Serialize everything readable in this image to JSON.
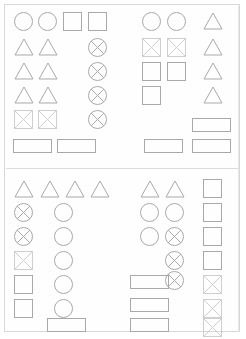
{
  "canvas": {
    "width": 246,
    "height": 339,
    "background": "#ffffff",
    "border_color": "#d8d8d8",
    "stroke_color": "#a9a9a9",
    "faint_stroke_color": "#cfcfcf"
  },
  "document": {
    "title": "Wireframe placeholder shape layout",
    "description": "Two-section page of outline placeholder glyphs arranged in columns",
    "section_count": 2,
    "divider_y": 168
  },
  "legend": {
    "shape_names": [
      "circle",
      "square",
      "triangle",
      "rectangle",
      "crossed-circle",
      "crossed-square"
    ]
  },
  "shapes": [
    {
      "id": "s1",
      "type": "circle",
      "x": 14,
      "y": 12,
      "w": 19,
      "h": 19,
      "faint": false
    },
    {
      "id": "s2",
      "type": "circle",
      "x": 38,
      "y": 12,
      "w": 19,
      "h": 19,
      "faint": false
    },
    {
      "id": "s3",
      "type": "square",
      "x": 63,
      "y": 12,
      "w": 19,
      "h": 19,
      "faint": false
    },
    {
      "id": "s4",
      "type": "square",
      "x": 88,
      "y": 12,
      "w": 19,
      "h": 19,
      "faint": false
    },
    {
      "id": "s5",
      "type": "triangle",
      "x": 14,
      "y": 38,
      "w": 20,
      "h": 18,
      "faint": false
    },
    {
      "id": "s6",
      "type": "triangle",
      "x": 38,
      "y": 38,
      "w": 20,
      "h": 18,
      "faint": false
    },
    {
      "id": "s7",
      "type": "crossed-circle",
      "x": 88,
      "y": 38,
      "w": 19,
      "h": 19,
      "faint": false
    },
    {
      "id": "s8",
      "type": "triangle",
      "x": 14,
      "y": 62,
      "w": 20,
      "h": 18,
      "faint": false
    },
    {
      "id": "s9",
      "type": "triangle",
      "x": 38,
      "y": 62,
      "w": 20,
      "h": 18,
      "faint": false
    },
    {
      "id": "s10",
      "type": "crossed-circle",
      "x": 88,
      "y": 62,
      "w": 19,
      "h": 19,
      "faint": false
    },
    {
      "id": "s11",
      "type": "triangle",
      "x": 14,
      "y": 86,
      "w": 20,
      "h": 18,
      "faint": false
    },
    {
      "id": "s12",
      "type": "triangle",
      "x": 38,
      "y": 86,
      "w": 20,
      "h": 18,
      "faint": false
    },
    {
      "id": "s13",
      "type": "crossed-circle",
      "x": 88,
      "y": 86,
      "w": 19,
      "h": 19,
      "faint": false
    },
    {
      "id": "s14",
      "type": "crossed-square",
      "x": 14,
      "y": 110,
      "w": 19,
      "h": 19,
      "faint": true
    },
    {
      "id": "s15",
      "type": "crossed-square",
      "x": 38,
      "y": 110,
      "w": 19,
      "h": 19,
      "faint": true
    },
    {
      "id": "s16",
      "type": "crossed-circle",
      "x": 88,
      "y": 110,
      "w": 19,
      "h": 19,
      "faint": false
    },
    {
      "id": "s17",
      "type": "rectangle",
      "x": 13,
      "y": 139,
      "w": 39,
      "h": 14,
      "faint": false
    },
    {
      "id": "s18",
      "type": "rectangle",
      "x": 57,
      "y": 139,
      "w": 39,
      "h": 14,
      "faint": false
    },
    {
      "id": "s19",
      "type": "circle",
      "x": 142,
      "y": 12,
      "w": 19,
      "h": 19,
      "faint": false
    },
    {
      "id": "s20",
      "type": "circle",
      "x": 167,
      "y": 12,
      "w": 19,
      "h": 19,
      "faint": false
    },
    {
      "id": "s21",
      "type": "triangle",
      "x": 203,
      "y": 12,
      "w": 20,
      "h": 18,
      "faint": false
    },
    {
      "id": "s22",
      "type": "crossed-square",
      "x": 142,
      "y": 38,
      "w": 19,
      "h": 19,
      "faint": true
    },
    {
      "id": "s23",
      "type": "crossed-square",
      "x": 167,
      "y": 38,
      "w": 19,
      "h": 19,
      "faint": true
    },
    {
      "id": "s24",
      "type": "triangle",
      "x": 203,
      "y": 38,
      "w": 20,
      "h": 18,
      "faint": false
    },
    {
      "id": "s25",
      "type": "square",
      "x": 142,
      "y": 62,
      "w": 19,
      "h": 19,
      "faint": false
    },
    {
      "id": "s26",
      "type": "square",
      "x": 167,
      "y": 62,
      "w": 19,
      "h": 19,
      "faint": false
    },
    {
      "id": "s27",
      "type": "triangle",
      "x": 203,
      "y": 62,
      "w": 20,
      "h": 18,
      "faint": false
    },
    {
      "id": "s28",
      "type": "square",
      "x": 142,
      "y": 86,
      "w": 19,
      "h": 19,
      "faint": false
    },
    {
      "id": "s29",
      "type": "triangle",
      "x": 203,
      "y": 86,
      "w": 20,
      "h": 18,
      "faint": false
    },
    {
      "id": "s30",
      "type": "rectangle",
      "x": 192,
      "y": 118,
      "w": 39,
      "h": 14,
      "faint": false
    },
    {
      "id": "s31",
      "type": "rectangle",
      "x": 144,
      "y": 139,
      "w": 39,
      "h": 14,
      "faint": false
    },
    {
      "id": "s32",
      "type": "rectangle",
      "x": 192,
      "y": 139,
      "w": 39,
      "h": 14,
      "faint": false
    },
    {
      "id": "s33",
      "type": "triangle",
      "x": 14,
      "y": 180,
      "w": 20,
      "h": 18,
      "faint": false
    },
    {
      "id": "s34",
      "type": "triangle",
      "x": 40,
      "y": 180,
      "w": 20,
      "h": 18,
      "faint": false
    },
    {
      "id": "s35",
      "type": "triangle",
      "x": 65,
      "y": 180,
      "w": 20,
      "h": 18,
      "faint": false
    },
    {
      "id": "s36",
      "type": "triangle",
      "x": 90,
      "y": 180,
      "w": 20,
      "h": 18,
      "faint": false
    },
    {
      "id": "s37",
      "type": "crossed-circle",
      "x": 14,
      "y": 203,
      "w": 19,
      "h": 19,
      "faint": false
    },
    {
      "id": "s38",
      "type": "circle",
      "x": 54,
      "y": 203,
      "w": 19,
      "h": 19,
      "faint": false
    },
    {
      "id": "s39",
      "type": "crossed-circle",
      "x": 14,
      "y": 227,
      "w": 19,
      "h": 19,
      "faint": false
    },
    {
      "id": "s40",
      "type": "circle",
      "x": 54,
      "y": 227,
      "w": 19,
      "h": 19,
      "faint": false
    },
    {
      "id": "s41",
      "type": "crossed-square",
      "x": 14,
      "y": 251,
      "w": 19,
      "h": 19,
      "faint": true
    },
    {
      "id": "s42",
      "type": "circle",
      "x": 54,
      "y": 251,
      "w": 19,
      "h": 19,
      "faint": false
    },
    {
      "id": "s43",
      "type": "square",
      "x": 14,
      "y": 275,
      "w": 19,
      "h": 19,
      "faint": false
    },
    {
      "id": "s44",
      "type": "circle",
      "x": 54,
      "y": 275,
      "w": 19,
      "h": 19,
      "faint": false
    },
    {
      "id": "s45",
      "type": "square",
      "x": 14,
      "y": 299,
      "w": 19,
      "h": 19,
      "faint": false
    },
    {
      "id": "s46",
      "type": "circle",
      "x": 54,
      "y": 299,
      "w": 19,
      "h": 19,
      "faint": false
    },
    {
      "id": "s47",
      "type": "rectangle",
      "x": 47,
      "y": 318,
      "w": 39,
      "h": 14,
      "faint": false
    },
    {
      "id": "s48",
      "type": "triangle",
      "x": 140,
      "y": 180,
      "w": 20,
      "h": 18,
      "faint": false
    },
    {
      "id": "s49",
      "type": "triangle",
      "x": 165,
      "y": 180,
      "w": 20,
      "h": 18,
      "faint": false
    },
    {
      "id": "s50",
      "type": "square",
      "x": 203,
      "y": 179,
      "w": 19,
      "h": 19,
      "faint": false
    },
    {
      "id": "s51",
      "type": "circle",
      "x": 140,
      "y": 203,
      "w": 19,
      "h": 19,
      "faint": false
    },
    {
      "id": "s52",
      "type": "circle",
      "x": 165,
      "y": 203,
      "w": 19,
      "h": 19,
      "faint": false
    },
    {
      "id": "s53",
      "type": "square",
      "x": 203,
      "y": 203,
      "w": 19,
      "h": 19,
      "faint": false
    },
    {
      "id": "s54",
      "type": "circle",
      "x": 140,
      "y": 227,
      "w": 19,
      "h": 19,
      "faint": false
    },
    {
      "id": "s55",
      "type": "crossed-circle",
      "x": 165,
      "y": 227,
      "w": 19,
      "h": 19,
      "faint": false
    },
    {
      "id": "s56",
      "type": "square",
      "x": 203,
      "y": 227,
      "w": 19,
      "h": 19,
      "faint": false
    },
    {
      "id": "s57",
      "type": "crossed-circle",
      "x": 165,
      "y": 251,
      "w": 19,
      "h": 19,
      "faint": false
    },
    {
      "id": "s58",
      "type": "square",
      "x": 203,
      "y": 251,
      "w": 19,
      "h": 19,
      "faint": false
    },
    {
      "id": "s59",
      "type": "rectangle",
      "x": 130,
      "y": 275,
      "w": 39,
      "h": 14,
      "faint": false
    },
    {
      "id": "s60",
      "type": "crossed-circle",
      "x": 165,
      "y": 271,
      "w": 19,
      "h": 19,
      "faint": false
    },
    {
      "id": "s61",
      "type": "crossed-square",
      "x": 203,
      "y": 275,
      "w": 19,
      "h": 19,
      "faint": true
    },
    {
      "id": "s62",
      "type": "rectangle",
      "x": 130,
      "y": 298,
      "w": 39,
      "h": 14,
      "faint": false
    },
    {
      "id": "s63",
      "type": "crossed-square",
      "x": 203,
      "y": 299,
      "w": 19,
      "h": 19,
      "faint": true
    },
    {
      "id": "s64",
      "type": "rectangle",
      "x": 130,
      "y": 318,
      "w": 39,
      "h": 14,
      "faint": false
    },
    {
      "id": "s65",
      "type": "crossed-square",
      "x": 203,
      "y": 318,
      "w": 19,
      "h": 19,
      "faint": true
    }
  ]
}
